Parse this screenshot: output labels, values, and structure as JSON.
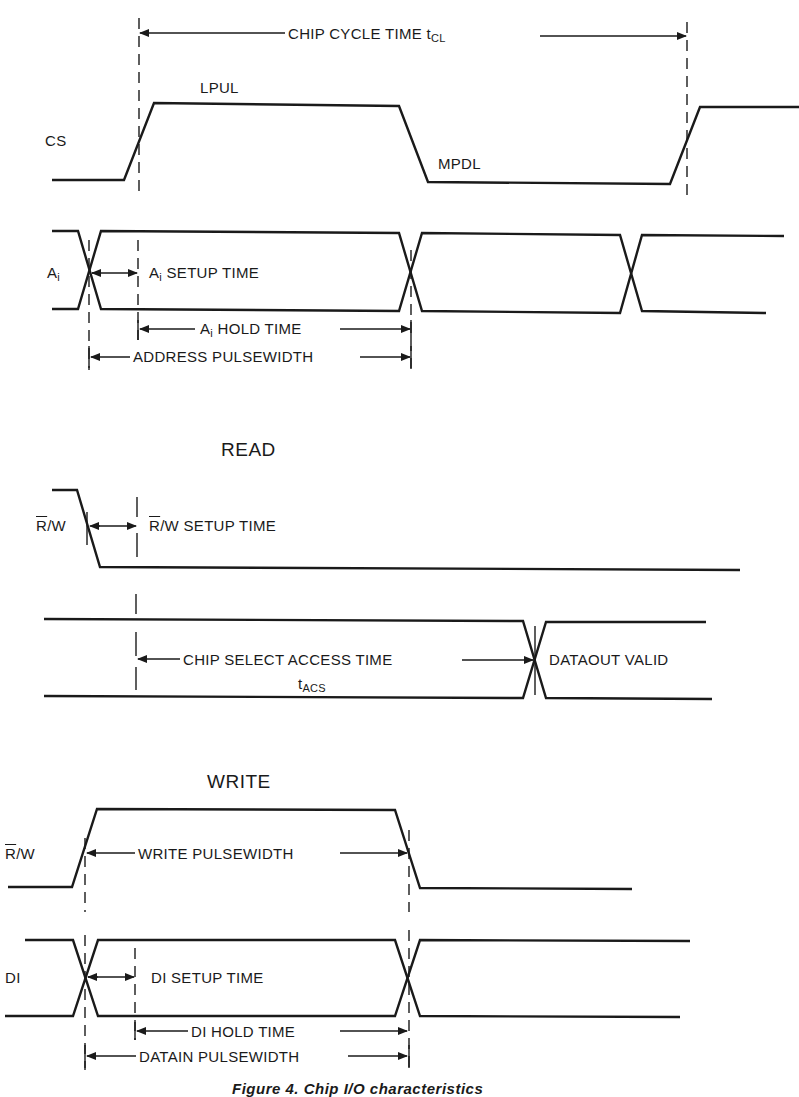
{
  "diagram": {
    "type": "timing-diagram",
    "sections": {
      "address": {
        "signals": {
          "cs": "CS",
          "ai": "A",
          "ai_sub": "i"
        },
        "labels": {
          "chip_cycle_time": "CHIP CYCLE TIME t",
          "chip_cycle_time_sub": "CL",
          "lpul": "LPUL",
          "mpdl": "MPDL",
          "ai_setup_prefix": "A",
          "ai_setup_sub": "i",
          "ai_setup": " SETUP TIME",
          "ai_hold_prefix": "A",
          "ai_hold_sub": "i",
          "ai_hold": " HOLD TIME",
          "address_pulsewidth": "ADDRESS PULSEWIDTH"
        }
      },
      "read": {
        "title": "READ",
        "signals": {
          "rw_r": "R",
          "rw_rest": "/W"
        },
        "labels": {
          "rw_setup_r": "R",
          "rw_setup_rest": "/W SETUP TIME",
          "chip_select_access": "CHIP SELECT ACCESS TIME",
          "tacs": "t",
          "tacs_sub": "ACS",
          "dataout_valid": "DATAOUT VALID"
        }
      },
      "write": {
        "title": "WRITE",
        "signals": {
          "rw_r": "R",
          "rw_rest": "/W",
          "di": "DI"
        },
        "labels": {
          "write_pulsewidth": "WRITE PULSEWIDTH",
          "di_setup": "DI SETUP TIME",
          "di_hold": "DI HOLD TIME",
          "datain_pulsewidth": "DATAIN PULSEWIDTH"
        }
      }
    },
    "caption": "Figure 4.  Chip I/O characteristics"
  }
}
